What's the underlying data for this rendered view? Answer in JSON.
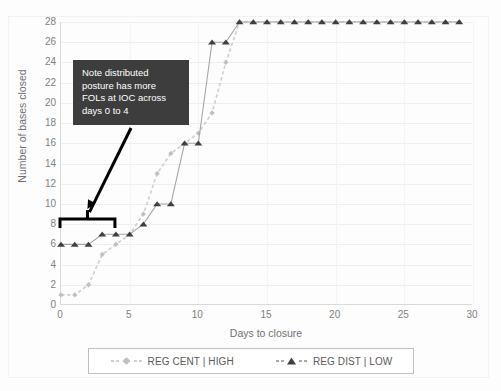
{
  "chart_data": {
    "type": "line",
    "title": "",
    "xlabel": "Days to closure",
    "ylabel": "Number of bases closed",
    "xlim": [
      0,
      30
    ],
    "ylim": [
      0,
      28
    ],
    "xticks": [
      0,
      5,
      10,
      15,
      20,
      25,
      30
    ],
    "yticks": [
      0,
      2,
      4,
      6,
      8,
      10,
      12,
      14,
      16,
      18,
      20,
      22,
      24,
      26,
      28
    ],
    "grid": true,
    "legend_position": "bottom",
    "series": [
      {
        "name": "REG CENT | HIGH",
        "marker": "diamond",
        "linestyle": "dotted",
        "color": "#bfbfbf",
        "x": [
          0,
          1,
          2,
          3,
          4,
          5,
          6,
          7,
          8,
          9,
          10,
          11,
          12,
          13,
          14,
          15,
          16,
          17,
          18,
          19,
          20,
          21,
          22,
          23,
          24,
          25,
          26,
          27,
          28,
          29
        ],
        "y": [
          1,
          1,
          2,
          5,
          6,
          7,
          9,
          13,
          15,
          16,
          17,
          19,
          24,
          28,
          28,
          28,
          28,
          28,
          28,
          28,
          28,
          28,
          28,
          28,
          28,
          28,
          28,
          28,
          28,
          28
        ]
      },
      {
        "name": "REG DIST | LOW",
        "marker": "triangle",
        "linestyle": "solid",
        "color": "#404040",
        "x": [
          0,
          1,
          2,
          3,
          4,
          5,
          6,
          7,
          8,
          9,
          10,
          11,
          12,
          13,
          14,
          15,
          16,
          17,
          18,
          19,
          20,
          21,
          22,
          23,
          24,
          25,
          26,
          27,
          28,
          29
        ],
        "y": [
          6,
          6,
          6,
          7,
          7,
          7,
          8,
          10,
          10,
          16,
          16,
          26,
          26,
          28,
          28,
          28,
          28,
          28,
          28,
          28,
          28,
          28,
          28,
          28,
          28,
          28,
          28,
          28,
          28,
          28
        ]
      }
    ],
    "annotations": [
      {
        "id": "note-callout",
        "text": "Note distributed\nposture has more\nFOLs at IOC across\ndays 0 to 4",
        "background": "#3d3d3d",
        "text_color": "#ffffff",
        "arrow_color": "#000000",
        "bracket_span_days": [
          0,
          4
        ],
        "bracket_y": 8.5
      }
    ]
  },
  "axes": {
    "y_title": "Number of bases closed",
    "x_title": "Days to closure",
    "y_tick_labels": [
      "28",
      "26",
      "24",
      "22",
      "20",
      "18",
      "16",
      "14",
      "12",
      "10",
      "8",
      "6",
      "4",
      "2",
      "0"
    ],
    "x_tick_labels": [
      "0",
      "5",
      "10",
      "15",
      "20",
      "25",
      "30"
    ]
  },
  "legend": {
    "items": [
      {
        "label": "REG CENT | HIGH",
        "marker": "diamond",
        "color": "#bfbfbf"
      },
      {
        "label": "REG DIST | LOW",
        "marker": "triangle",
        "color": "#404040"
      }
    ]
  },
  "callout": {
    "text": "Note distributed\nposture has more\nFOLs at IOC across\ndays 0 to 4"
  },
  "colors": {
    "series_high": "#bfbfbf",
    "series_low": "#404040",
    "callout_bg": "#3d3d3d",
    "axis": "#d9d9d9",
    "grid": "#eeeeee",
    "tick_text": "#808080"
  }
}
